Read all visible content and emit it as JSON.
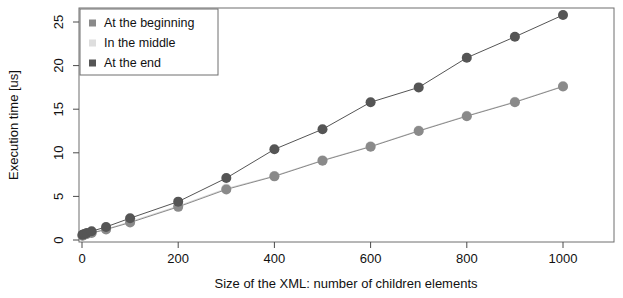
{
  "chart_data": {
    "type": "line",
    "title": "",
    "subtitle": "",
    "xlabel": "Size of the XML: number of children elements",
    "ylabel": "Execution time [us]",
    "xlim": [
      -20,
      1040
    ],
    "ylim": [
      -0.6,
      26.8
    ],
    "xticks": [
      0,
      200,
      400,
      600,
      800,
      1000
    ],
    "xticklabels": [
      "0",
      "200",
      "400",
      "600",
      "800",
      "1000"
    ],
    "yticks": [
      0,
      5,
      10,
      15,
      20,
      25
    ],
    "yticklabels": [
      "0",
      "5",
      "10",
      "15",
      "20",
      "25"
    ],
    "grid": false,
    "legend_position": "upper-left",
    "x": [
      1,
      5,
      10,
      20,
      50,
      100,
      200,
      300,
      400,
      500,
      600,
      700,
      800,
      900,
      1000
    ],
    "series": [
      {
        "name": "At the beginning",
        "color": "#8a8a8a",
        "marker": "circle",
        "values": [
          0.5,
          0.6,
          0.7,
          0.8,
          1.2,
          2.0,
          3.8,
          5.8,
          7.3,
          9.1,
          10.7,
          12.5,
          14.2,
          15.8,
          17.6
        ]
      },
      {
        "name": "In the middle",
        "color": "#d9d9d9",
        "marker": "circle",
        "values": [
          0.5,
          0.6,
          0.7,
          0.85,
          1.25,
          2.1,
          3.9,
          5.9,
          7.35,
          9.15,
          10.75,
          12.55,
          14.25,
          15.85,
          17.65
        ]
      },
      {
        "name": "At the end",
        "color": "#555555",
        "marker": "circle",
        "values": [
          0.6,
          0.7,
          0.8,
          1.0,
          1.5,
          2.5,
          4.4,
          7.1,
          10.4,
          12.7,
          15.8,
          17.5,
          20.9,
          23.3,
          25.8
        ]
      }
    ]
  },
  "legend": {
    "entries": [
      {
        "label": "At the beginning"
      },
      {
        "label": "In the middle"
      },
      {
        "label": "At the end"
      }
    ]
  },
  "colors": {
    "axis": "#4a4a4a",
    "frame": "#6e6e6e",
    "text": "#111111",
    "background": "#ffffff"
  }
}
